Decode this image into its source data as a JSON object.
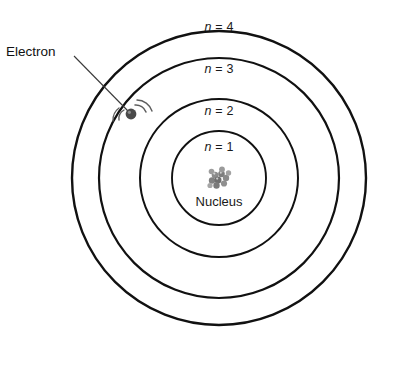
{
  "diagram": {
    "type": "bohr-atom",
    "background_color": "#ffffff",
    "stroke_color": "#111111",
    "center": {
      "x": 219,
      "y": 178
    },
    "shells": [
      {
        "id": "n1",
        "label_n": "n",
        "label_eq": "= 1",
        "radius": 47,
        "label_x": 219,
        "label_y": 140,
        "stroke_width": 1.9
      },
      {
        "id": "n2",
        "label_n": "n",
        "label_eq": "= 2",
        "radius": 79,
        "label_x": 219,
        "label_y": 104,
        "stroke_width": 2.0
      },
      {
        "id": "n3",
        "label_n": "n",
        "label_eq": "= 3",
        "radius": 120,
        "label_x": 219,
        "label_y": 62,
        "stroke_width": 2.2
      },
      {
        "id": "n4",
        "label_n": "n",
        "label_eq": "= 4",
        "radius": 147,
        "label_x": 219,
        "label_y": 20,
        "stroke_width": 2.4
      }
    ],
    "nucleus": {
      "label": "Nucleus",
      "label_x": 219,
      "label_y": 203,
      "center_x": 219,
      "center_y": 180,
      "color": "#777777",
      "highlight_color": "#b9b9b9",
      "blob_count": 11
    },
    "electron": {
      "label": "Electron",
      "label_x": 6,
      "label_y": 44,
      "dot_x": 131,
      "dot_y": 114,
      "dot_radius": 5.4,
      "color": "#4a4a4a",
      "motion_arc_color": "#5a5a5a",
      "leader_line": {
        "x1": 74,
        "y1": 56,
        "x2": 128,
        "y2": 111
      }
    }
  }
}
